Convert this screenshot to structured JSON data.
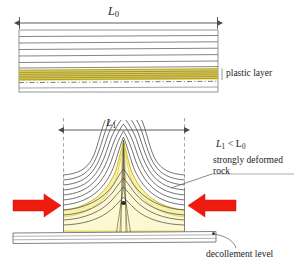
{
  "figure": {
    "type": "geological-cross-section"
  },
  "panels": {
    "undeformed": {
      "name": "undeformed-layered-sequence",
      "dimension_label": "L",
      "dimension_sub": "0",
      "plastic_layer_label": "plastic layer",
      "layer_count": 9,
      "plastic_layer_color": "#c8b400",
      "plastic_layer_fill": "#dfd37a",
      "bedding_color": "#6b6b6b"
    },
    "deformed": {
      "name": "deformed-folded-sequence",
      "dimension_label": "L",
      "dimension_sub": "1",
      "inequality": "L₁ < L₀",
      "inequality_base": "L",
      "inequality_sub1": "1",
      "inequality_mid": " < L",
      "inequality_sub2": "0",
      "deformed_rock_label_line1": "strongly deformed",
      "deformed_rock_label_line2": "rock",
      "decollement_label": "decollement level",
      "fold_core_fill": "#f7efab",
      "fold_core_stroke": "#c8b400",
      "bedding_color": "#4a4a4a"
    }
  },
  "arrows": {
    "shortening_color": "#f01b0f",
    "left_arrow_name": "left-shortening-arrow",
    "right_arrow_name": "right-shortening-arrow",
    "dimension_arrow_color": "#4a4a4a"
  },
  "guides": {
    "dash_color": "#8a8a8a",
    "left_guide_x": 63,
    "right_guide_x": 185
  }
}
